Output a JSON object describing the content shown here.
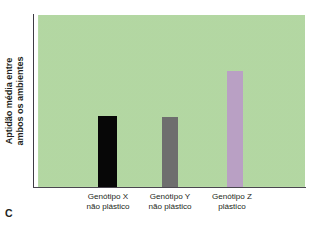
{
  "figure": {
    "panel_letter": "C",
    "background_color": "#ffffff"
  },
  "axes": {
    "y_title_line1": "Aptidão média entre",
    "y_title_line2": "ambos os ambientes",
    "axis_line_color": "#3e3a44",
    "plot_background_color": "#b7dca6"
  },
  "chart_data": {
    "type": "bar",
    "title": "",
    "xlabel": "",
    "ylabel": "Aptidão média entre ambos os ambientes",
    "categories": [
      "Genótipo X\nnão plástico",
      "Genótipo Y\nnão plástico",
      "Genótipo Z\nplástico"
    ],
    "category_lines": [
      [
        "Genótipo X",
        "não plástico"
      ],
      [
        "Genótipo Y",
        "não plástico"
      ],
      [
        "Genótipo Z",
        "plástico"
      ]
    ],
    "values": [
      41,
      40,
      67
    ],
    "ylim": [
      0,
      100
    ],
    "grid": false,
    "legend": null,
    "bar_colors": [
      "#070707",
      "#6e6e6e",
      "#b9a0c4"
    ],
    "bars": [
      {
        "label": "Genótipo X não plástico",
        "value": 41,
        "color": "#070707",
        "height_px": 71
      },
      {
        "label": "Genótipo Y não plástico",
        "value": 40,
        "color": "#6e6e6e",
        "height_px": 70
      },
      {
        "label": "Genótipo Z plástico",
        "value": 67,
        "color": "#b9a0c4",
        "height_px": 116
      }
    ]
  }
}
